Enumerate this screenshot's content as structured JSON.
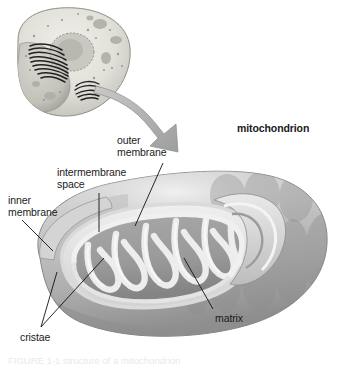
{
  "figure": {
    "title_label": "mitochondrion",
    "background_color": "#ffffff",
    "text_color": "#1a1a1a",
    "caption": "FIGURE 1-1  structure of a mitochondrion"
  },
  "labels": {
    "mitochondrion": "mitochondrion",
    "outer_membrane": "outer\nmembrane",
    "intermembrane_space": "intermembrane\nspace",
    "inner_membrane": "inner\nmembrane",
    "matrix": "matrix",
    "cristae": "cristae"
  },
  "inset": {
    "name": "animal-cell-cutaway",
    "description": "cut-away animal cell showing nucleus, endoplasmic reticulum and Golgi apparatus"
  },
  "arrow": {
    "name": "magnify-arrow",
    "direction": "down-right",
    "color": "#a9a9a9"
  },
  "colors": {
    "membrane_light": "#e4e4e4",
    "matrix_mid": "#9e9e9e",
    "matrix_dark": "#8a8a8a",
    "body_light": "#cfcfcf",
    "body_shadow": "#9a9a9a",
    "outline": "#7d7d7d",
    "leader_line": "#111111"
  },
  "structures": [
    {
      "name": "outer-membrane",
      "label": "outer membrane"
    },
    {
      "name": "inner-membrane",
      "label": "inner membrane"
    },
    {
      "name": "intermembrane-space",
      "label": "intermembrane space"
    },
    {
      "name": "cristae",
      "label": "cristae",
      "count": 7
    },
    {
      "name": "matrix",
      "label": "matrix"
    }
  ]
}
